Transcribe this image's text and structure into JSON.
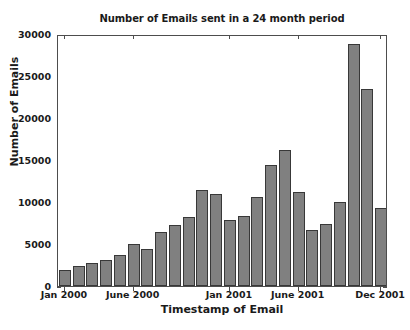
{
  "chart_data": {
    "type": "bar",
    "title": "Number of Emails sent in a 24 month period",
    "xlabel": "Timestamp of Email",
    "ylabel": "Number of Emails",
    "ylim": [
      0,
      30000
    ],
    "ytick_labels": [
      "0",
      "5000",
      "10000",
      "15000",
      "20000",
      "25000",
      "30000"
    ],
    "ytick_values": [
      0,
      5000,
      10000,
      15000,
      20000,
      25000,
      30000
    ],
    "grid": false,
    "legend": null,
    "bar_color": "#808080",
    "bar_edge_color": "#383838",
    "categories": [
      "Jan 2000",
      "Feb 2000",
      "Mar 2000",
      "Apr 2000",
      "May 2000",
      "June 2000",
      "July 2000",
      "Aug 2000",
      "Sep 2000",
      "Oct 2000",
      "Nov 2000",
      "Dec 2000",
      "Jan 2001",
      "Feb 2001",
      "Mar 2001",
      "Apr 2001",
      "May 2001",
      "June 2001",
      "July 2001",
      "Aug 2001",
      "Sep 2001",
      "Oct 2001",
      "Nov 2001",
      "Dec 2001"
    ],
    "values": [
      1900,
      2400,
      2700,
      3100,
      3700,
      4950,
      4450,
      6400,
      7250,
      8250,
      11400,
      10950,
      7800,
      8300,
      10650,
      14450,
      16200,
      11200,
      6650,
      7350,
      10000,
      28800,
      23500,
      9300
    ],
    "xtick_labels": [
      "Jan 2000",
      "June 2000",
      "Jan 2001",
      "June 2001",
      "Dec 2001"
    ],
    "xtick_category_index": [
      0,
      5,
      12,
      17,
      23
    ]
  }
}
